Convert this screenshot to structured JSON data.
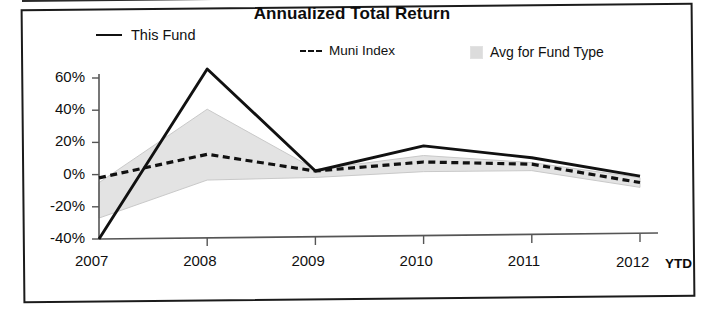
{
  "chart_data": {
    "type": "line",
    "title": "Annualized Total Return",
    "xlabel": "",
    "ylabel": "",
    "x": [
      "2007",
      "2008",
      "2009",
      "2010",
      "2011",
      "2012"
    ],
    "categories": [
      "2007",
      "2008",
      "2009",
      "2010",
      "2011",
      "2012"
    ],
    "x_axis_note": "YTD",
    "ylim": [
      -40,
      60
    ],
    "yticks": [
      60,
      40,
      20,
      0,
      -20,
      -40
    ],
    "ytick_labels": [
      "60%",
      "40%",
      "20%",
      "0%",
      "-20%",
      "-40%"
    ],
    "grid": false,
    "legend_position": "top",
    "series": [
      {
        "name": "This Fund",
        "style": "solid",
        "color": "#111111",
        "values": [
          -40,
          65,
          1,
          16,
          8,
          -4
        ]
      },
      {
        "name": "Muni Index",
        "style": "dashed",
        "color": "#111111",
        "values": [
          -2,
          12,
          1,
          6,
          4,
          -8
        ]
      },
      {
        "name": "Avg for Fund Type",
        "style": "band",
        "color": "#dcdcdc",
        "band_upper": [
          -5,
          40,
          2,
          10,
          5,
          -5
        ],
        "band_lower": [
          -27,
          -4,
          -3,
          0,
          0,
          -11
        ]
      }
    ],
    "legend": [
      {
        "label": "This Fund",
        "marker": "solid-line"
      },
      {
        "label": "Muni Index",
        "marker": "dashed-line"
      },
      {
        "label": "Avg for Fund Type",
        "marker": "filled-square"
      }
    ],
    "colors": {
      "line": "#111111",
      "band_fill": "#e3e3e3",
      "band_stroke": "#c9c9c9",
      "axis": "#555555",
      "frame": "#1b1b1b"
    }
  }
}
